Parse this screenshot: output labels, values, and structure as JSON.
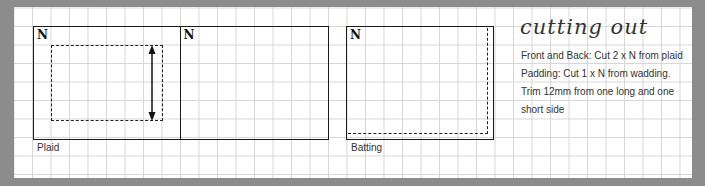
{
  "diagram": {
    "panels": [
      {
        "id": "plaid-front",
        "corner_label": "N"
      },
      {
        "id": "plaid-back",
        "corner_label": "N"
      },
      {
        "id": "batting",
        "corner_label": "N"
      }
    ],
    "captions": {
      "plaid": "Plaid",
      "batting": "Batting"
    }
  },
  "instructions": {
    "title": "cutting out",
    "lines": [
      "Front and Back: Cut 2 x N from plaid",
      "Padding: Cut 1 x N from wadding.",
      "Trim 12mm from one long and one",
      "short side"
    ]
  },
  "colors": {
    "frame": "#8c8c8c",
    "paper": "#ffffff",
    "grid": "#d6d6d6",
    "ink": "#1a1a1a"
  }
}
